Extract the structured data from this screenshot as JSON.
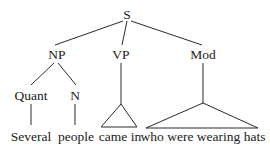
{
  "diagram": {
    "type": "syntax-tree",
    "nodes": {
      "S": "S",
      "NP": "NP",
      "VP": "VP",
      "Mod": "Mod",
      "Quant": "Quant",
      "N": "N"
    },
    "leaves": {
      "several": "Several",
      "people": "people",
      "came_in": "came in",
      "who_were": "who were wearing hats"
    },
    "edges": [
      [
        "S",
        "NP"
      ],
      [
        "S",
        "VP"
      ],
      [
        "S",
        "Mod"
      ],
      [
        "NP",
        "Quant"
      ],
      [
        "NP",
        "N"
      ],
      [
        "Quant",
        "Several"
      ],
      [
        "N",
        "people"
      ],
      [
        "VP",
        "came in (triangle)"
      ],
      [
        "Mod",
        "who were wearing hats (triangle)"
      ]
    ]
  }
}
